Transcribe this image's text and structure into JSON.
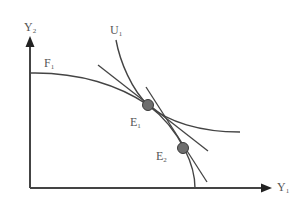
{
  "diagram": {
    "type": "production-possibility-frontier with indifference curve",
    "axes": {
      "y_label": "Y",
      "y_sub": "2",
      "x_label": "Y",
      "x_sub": "1"
    },
    "curves": {
      "frontier_label": "F",
      "frontier_sub": "1",
      "indifference_label": "U",
      "indifference_sub": "1"
    },
    "points": [
      {
        "label": "E",
        "sub": "1"
      },
      {
        "label": "E",
        "sub": "2"
      }
    ],
    "colors": {
      "line": "#444444",
      "point_fill": "#6e6e6e",
      "point_stroke": "#3a3a3a",
      "text": "#555555",
      "background": "#ffffff"
    }
  }
}
